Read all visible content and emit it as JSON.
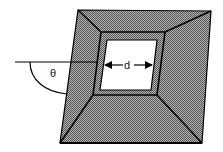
{
  "diagram": {
    "labels": {
      "angle": "θ",
      "width": "d"
    },
    "colors": {
      "fill_texture": "#8a8a8a",
      "fill_light": "#a8a8a8",
      "outline": "#000000",
      "aperture": "#ffffff"
    },
    "geometry": {
      "outer": [
        [
          78,
          10
        ],
        [
          211,
          11
        ],
        [
          202,
          143
        ],
        [
          60,
          143
        ]
      ],
      "middle": [
        [
          101,
          32
        ],
        [
          165,
          32
        ],
        [
          157,
          95
        ],
        [
          93,
          95
        ]
      ],
      "inner": [
        [
          107,
          40
        ],
        [
          157,
          40
        ],
        [
          151,
          90
        ],
        [
          100,
          90
        ]
      ]
    }
  }
}
